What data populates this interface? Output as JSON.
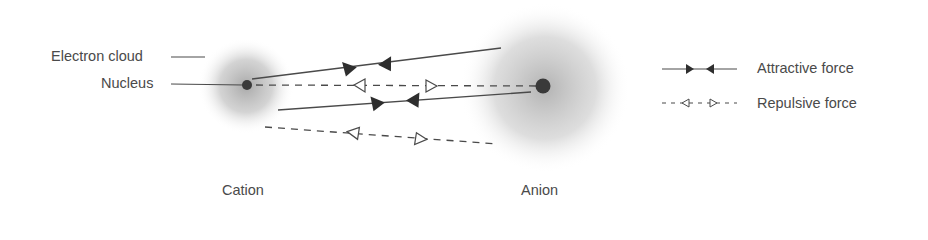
{
  "labels": {
    "electron_cloud": "Electron cloud",
    "nucleus": "Nucleus",
    "cation": "Cation",
    "anion": "Anion"
  },
  "legend": {
    "attractive": "Attractive force",
    "repulsive": "Repulsive force"
  },
  "colors": {
    "line": "#4a4a4a",
    "nucleus": "#3a3a3a",
    "cloud": "#9a9a9a",
    "text": "#4a4a4a"
  }
}
